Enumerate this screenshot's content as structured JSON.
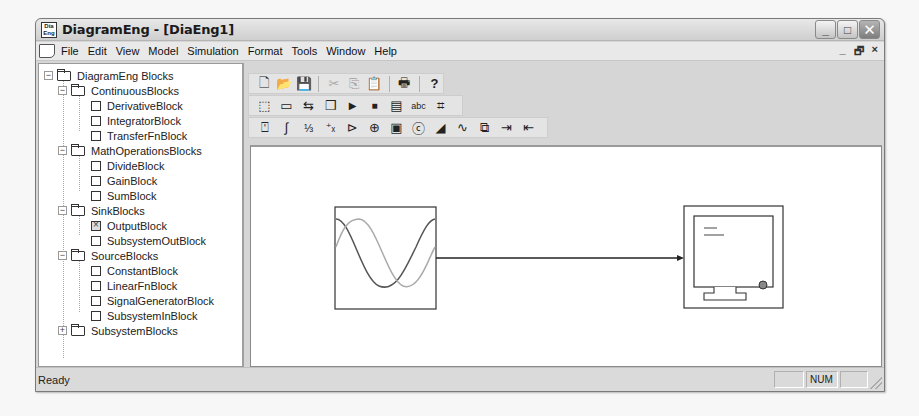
{
  "window": {
    "title": "DiagramEng - [DiaEng1]",
    "app_icon_text": "Dia Eng",
    "caption_buttons": [
      "minimize",
      "maximize",
      "close"
    ],
    "caption_glyphs": {
      "minimize": "_",
      "maximize": "□",
      "close": "✕"
    },
    "mdi_glyphs": {
      "minimize": "_",
      "restore": "🗗",
      "close": "×"
    }
  },
  "menu": {
    "items": [
      {
        "label": "File",
        "mnemonic": "F"
      },
      {
        "label": "Edit",
        "mnemonic": "E"
      },
      {
        "label": "View",
        "mnemonic": "V"
      },
      {
        "label": "Model",
        "mnemonic": "M"
      },
      {
        "label": "Simulation",
        "mnemonic": "S"
      },
      {
        "label": "Format",
        "mnemonic": "o"
      },
      {
        "label": "Tools",
        "mnemonic": "T"
      },
      {
        "label": "Window",
        "mnemonic": "W"
      },
      {
        "label": "Help",
        "mnemonic": "H"
      }
    ]
  },
  "tree": {
    "root": "DiagramEng Blocks",
    "groups": [
      {
        "label": "ContinuousBlocks",
        "expanded": true,
        "items": [
          "DerivativeBlock",
          "IntegratorBlock",
          "TransferFnBlock"
        ]
      },
      {
        "label": "MathOperationsBlocks",
        "expanded": true,
        "items": [
          "DivideBlock",
          "GainBlock",
          "SumBlock"
        ]
      },
      {
        "label": "SinkBlocks",
        "expanded": true,
        "items": [
          "OutputBlock",
          "SubsystemOutBlock"
        ]
      },
      {
        "label": "SourceBlocks",
        "expanded": true,
        "items": [
          "ConstantBlock",
          "LinearFnBlock",
          "SignalGeneratorBlock",
          "SubsystemInBlock"
        ]
      },
      {
        "label": "SubsystemBlocks",
        "expanded": false,
        "items": []
      }
    ],
    "selected_item": "OutputBlock"
  },
  "toolbars": {
    "standard": [
      {
        "name": "new-icon",
        "glyph": "🗋",
        "enabled": true
      },
      {
        "name": "open-icon",
        "glyph": "📂",
        "enabled": true
      },
      {
        "name": "save-icon",
        "glyph": "💾",
        "enabled": true
      },
      {
        "sep": true
      },
      {
        "name": "cut-icon",
        "glyph": "✂",
        "enabled": false
      },
      {
        "name": "copy-icon",
        "glyph": "⎘",
        "enabled": false
      },
      {
        "name": "paste-icon",
        "glyph": "📋",
        "enabled": false
      },
      {
        "sep": true
      },
      {
        "name": "print-icon",
        "glyph": "🖶",
        "enabled": true
      },
      {
        "sep": true
      },
      {
        "name": "help-icon",
        "glyph": "?",
        "enabled": true
      }
    ],
    "common_ops": [
      {
        "name": "select-all-icon",
        "glyph": "⬚",
        "enabled": true
      },
      {
        "name": "frame-icon",
        "glyph": "▭",
        "enabled": true
      },
      {
        "name": "auto-fit-icon",
        "glyph": "⇆",
        "enabled": true
      },
      {
        "name": "build-model-icon",
        "glyph": "❒",
        "enabled": true
      },
      {
        "name": "start-simulation-icon",
        "glyph": "▶",
        "enabled": true
      },
      {
        "name": "stop-simulation-icon",
        "glyph": "■",
        "enabled": true
      },
      {
        "name": "numerical-solver-icon",
        "glyph": "▤",
        "enabled": true
      },
      {
        "name": "show-annotations-icon",
        "glyph": "abc",
        "enabled": true
      },
      {
        "name": "track-multiple-items-icon",
        "glyph": "⌗",
        "enabled": true
      }
    ],
    "blocks": [
      {
        "name": "derivative-block-icon",
        "glyph": "⍞",
        "enabled": true
      },
      {
        "name": "integrator-block-icon",
        "glyph": "∫",
        "enabled": true
      },
      {
        "name": "transfer-fn-block-icon",
        "glyph": "⅓",
        "enabled": true
      },
      {
        "name": "divide-block-icon",
        "glyph": "⁺ₓ",
        "enabled": true
      },
      {
        "name": "gain-block-icon",
        "glyph": "⊳",
        "enabled": true
      },
      {
        "name": "sum-block-icon",
        "glyph": "⊕",
        "enabled": true
      },
      {
        "name": "output-block-icon",
        "glyph": "▣",
        "enabled": true
      },
      {
        "name": "constant-block-icon",
        "glyph": "ⓒ",
        "enabled": true
      },
      {
        "name": "linear-fn-block-icon",
        "glyph": "◢",
        "enabled": true
      },
      {
        "name": "signal-generator-block-icon",
        "glyph": "∿",
        "enabled": true
      },
      {
        "name": "subsystem-block-icon",
        "glyph": "⧉",
        "enabled": true
      },
      {
        "name": "subsystem-in-block-icon",
        "glyph": "⇥",
        "enabled": true
      },
      {
        "name": "subsystem-out-block-icon",
        "glyph": "⇤",
        "enabled": true
      }
    ]
  },
  "diagram": {
    "blocks": [
      {
        "type": "SignalGeneratorBlock",
        "x": 84,
        "y": 60,
        "w": 101,
        "h": 102
      },
      {
        "type": "OutputBlock",
        "x": 433,
        "y": 59,
        "w": 99,
        "h": 102
      }
    ],
    "connections": [
      {
        "from": "SignalGeneratorBlock",
        "to": "OutputBlock",
        "y": 111
      }
    ]
  },
  "status": {
    "text": "Ready",
    "panes": [
      "",
      "NUM",
      ""
    ]
  }
}
